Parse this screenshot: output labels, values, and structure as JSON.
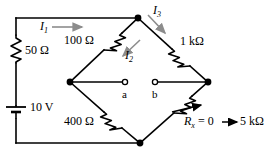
{
  "figure": {
    "type": "circuit-schematic"
  },
  "components": {
    "source": {
      "name": "battery",
      "label": "10 V",
      "value": "10",
      "unit": "V"
    },
    "series_resistor": {
      "name": "resistor-50-ohm",
      "label": "50 Ω",
      "value": "50",
      "unit": "Ω"
    },
    "bridge_top_left": {
      "name": "resistor-100-ohm",
      "label": "100 Ω",
      "value": "100",
      "unit": "Ω"
    },
    "bridge_top_right": {
      "name": "resistor-1-kilohm",
      "label": "1 kΩ",
      "value": "1",
      "unit": "kΩ"
    },
    "bridge_bottom_left": {
      "name": "resistor-400-ohm",
      "label": "400 Ω",
      "value": "400",
      "unit": "Ω"
    },
    "bridge_bottom_right": {
      "name": "variable-resistor-rx",
      "symbol": "R",
      "subscript": "x",
      "equals": "= 0",
      "range_end": "5 kΩ",
      "label_full": "Rₓ = 0 → 5 kΩ"
    }
  },
  "currents": [
    {
      "symbol": "I",
      "subscript": "1",
      "label": "I₁",
      "direction": "right"
    },
    {
      "symbol": "I",
      "subscript": "2",
      "label": "I₂",
      "direction": "down-left"
    },
    {
      "symbol": "I",
      "subscript": "3",
      "label": "I₃",
      "direction": "down-right"
    }
  ],
  "terminals": [
    {
      "name": "terminal-a",
      "label": "a"
    },
    {
      "name": "terminal-b",
      "label": "b"
    }
  ],
  "colors": {
    "wire": "#000000",
    "background": "#ffffff",
    "arrow_gray": "#8c8c8c",
    "node_fill": "#000000"
  }
}
